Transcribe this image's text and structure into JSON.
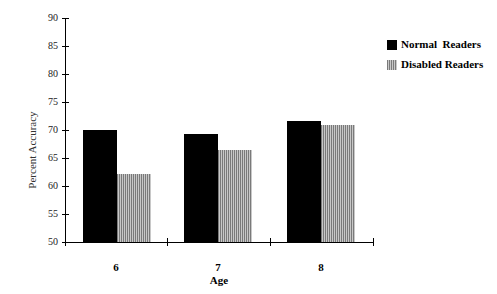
{
  "chart_data": {
    "type": "bar",
    "title": "",
    "xlabel": "Age",
    "ylabel": "Percent Accuracy",
    "categories": [
      "6",
      "7",
      "8"
    ],
    "series": [
      {
        "name": "Normal  Readers",
        "values": [
          70.0,
          69.3,
          71.6
        ],
        "color": "#000000",
        "pattern": "solid"
      },
      {
        "name": "Disabled Readers",
        "values": [
          62.2,
          66.4,
          70.9
        ],
        "color": "#9a9a9a",
        "pattern": "vertical-stripes"
      }
    ],
    "ylim": [
      50,
      90
    ],
    "yticks": [
      "90",
      "85",
      "80",
      "75",
      "70",
      "65",
      "60",
      "55",
      "50"
    ],
    "grid": false,
    "legend_position": "top-right"
  },
  "legend": {
    "items": [
      {
        "label": "Normal  Readers"
      },
      {
        "label": "Disabled Readers"
      }
    ]
  }
}
